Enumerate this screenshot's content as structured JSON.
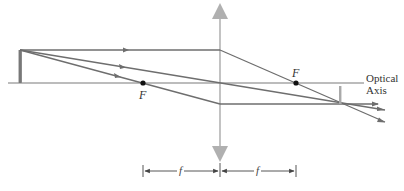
{
  "diagram": {
    "type": "converging-lens-ray-diagram",
    "labels": {
      "left_focal_point": "F",
      "right_focal_point": "F",
      "optical_axis_line1": "Optical",
      "optical_axis_line2": "Axis",
      "focal_length_left": "f",
      "focal_length_right": "f"
    },
    "colors": {
      "ray": "#6e6e6e",
      "axis": "#7a7a7a",
      "lens": "#9a9a9a",
      "lens_arrow_fill": "#b0b0b0",
      "object": "#8a8a8a",
      "focal_point": "#111111",
      "text": "#333333"
    },
    "elements": {
      "optical_axis": "horizontal line through lens center",
      "lens": "thin converging lens (vertical line with outward arrowheads)",
      "object": "upright arrow left of left focal point",
      "image": "inverted real image right of right focal point",
      "rays": [
        "parallel ray refracted through right focal point",
        "central ray undeviated through lens center",
        "focal ray through left focal point exits parallel"
      ],
      "dimension": "focal length f marked on both sides of lens"
    }
  }
}
